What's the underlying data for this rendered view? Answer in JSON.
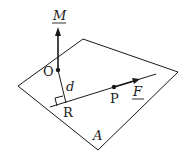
{
  "diagram": {
    "labels": {
      "moment": "M",
      "origin": "O",
      "distance": "d",
      "foot": "R",
      "point": "P",
      "force": "F",
      "plane": "A"
    },
    "colors": {
      "stroke": "#1a1a1a",
      "background": "#ffffff"
    }
  }
}
